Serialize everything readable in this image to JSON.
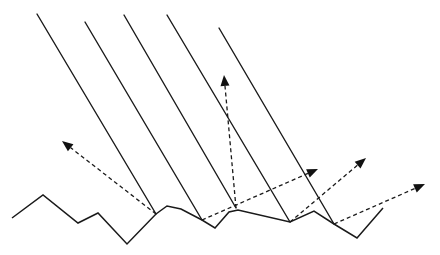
{
  "diagram": {
    "title": "",
    "colors": {
      "line": "#1a1a1a",
      "arrowhead": "#111111",
      "background": "#ffffff"
    },
    "surface": {
      "points": [
        [
          12,
          218
        ],
        [
          43,
          195
        ],
        [
          78,
          223
        ],
        [
          98,
          213
        ],
        [
          127,
          244
        ],
        [
          156,
          214
        ],
        [
          167,
          206
        ],
        [
          181,
          209
        ],
        [
          202,
          220
        ],
        [
          215,
          228
        ],
        [
          229,
          212
        ],
        [
          238,
          210
        ],
        [
          290,
          222
        ],
        [
          314,
          211
        ],
        [
          334,
          224
        ],
        [
          357,
          238
        ],
        [
          383,
          208
        ]
      ]
    },
    "incident_rays": [
      {
        "from": [
          37,
          14
        ],
        "to": [
          156,
          214
        ]
      },
      {
        "from": [
          85,
          22
        ],
        "to": [
          202,
          220
        ]
      },
      {
        "from": [
          124,
          15
        ],
        "to": [
          236,
          208
        ]
      },
      {
        "from": [
          167,
          15
        ],
        "to": [
          290,
          222
        ]
      },
      {
        "from": [
          219,
          28
        ],
        "to": [
          334,
          224
        ]
      }
    ],
    "reflected_rays": [
      {
        "from": [
          156,
          214
        ],
        "to": [
          62,
          141
        ]
      },
      {
        "from": [
          202,
          220
        ],
        "to": [
          318,
          169
        ]
      },
      {
        "from": [
          236,
          208
        ],
        "to": [
          224,
          75
        ]
      },
      {
        "from": [
          290,
          222
        ],
        "to": [
          366,
          158
        ]
      },
      {
        "from": [
          334,
          224
        ],
        "to": [
          425,
          184
        ]
      }
    ]
  }
}
